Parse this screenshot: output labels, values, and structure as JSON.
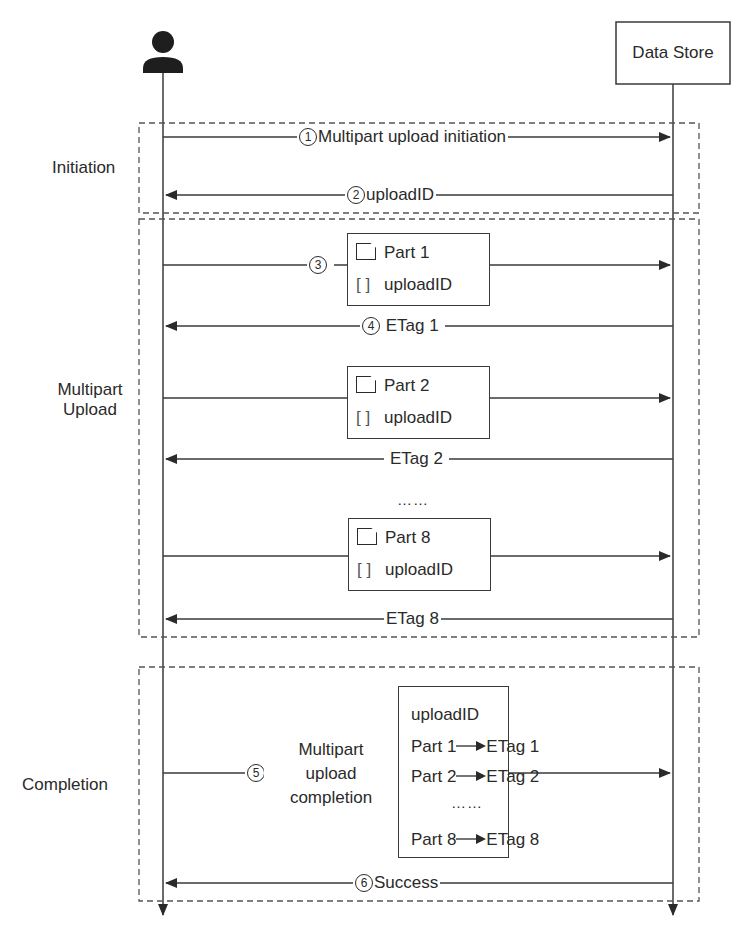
{
  "actors": {
    "client": {
      "icon": "person-icon"
    },
    "server": {
      "label": "Data Store"
    }
  },
  "phases": [
    {
      "label": "Initiation"
    },
    {
      "label": "Multipart\nUpload",
      "line1": "Multipart",
      "line2": "Upload"
    },
    {
      "label": "Completion"
    }
  ],
  "messages": {
    "m1": {
      "num": "1",
      "label": "Multipart upload initiation",
      "direction": "to-server"
    },
    "m2": {
      "num": "2",
      "label": "uploadID",
      "direction": "to-client"
    },
    "m3": {
      "num": "3",
      "direction": "to-server"
    },
    "m4": {
      "num": "4",
      "label": "ETag 1",
      "direction": "to-client"
    },
    "etag2": {
      "label": "ETag 2",
      "direction": "to-client"
    },
    "etag8": {
      "label": "ETag 8",
      "direction": "to-client"
    },
    "m5": {
      "num": "5",
      "line1": "Multipart",
      "line2": "upload",
      "line3": "completion",
      "direction": "to-server"
    },
    "m6": {
      "num": "6",
      "label": "Success",
      "direction": "to-client"
    }
  },
  "part_boxes": [
    {
      "part": "Part 1",
      "id": "uploadID",
      "bracket": "[   ]"
    },
    {
      "part": "Part 2",
      "id": "uploadID",
      "bracket": "[   ]"
    },
    {
      "part": "Part 8",
      "id": "uploadID",
      "bracket": "[   ]"
    }
  ],
  "ellipsis": "……",
  "completion_box": {
    "header": "uploadID",
    "rows": [
      {
        "part": "Part 1",
        "etag": "ETag 1"
      },
      {
        "part": "Part 2",
        "etag": "ETag 2"
      },
      {
        "part": "Part 8",
        "etag": "ETag 8"
      }
    ],
    "ellipsis": "……"
  },
  "colors": {
    "line": "#3a3a3a",
    "text": "#2a2a2a",
    "background": "#ffffff"
  }
}
